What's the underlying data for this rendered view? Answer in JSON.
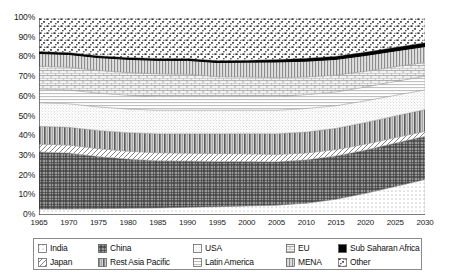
{
  "chart_data": {
    "type": "area",
    "title": "",
    "xlabel": "",
    "ylabel": "",
    "stacked": true,
    "percent_stacked": true,
    "grid": false,
    "legend_position": "bottom",
    "xlim": [
      1965,
      2030
    ],
    "ylim": [
      0,
      100
    ],
    "x": [
      1965,
      1970,
      1975,
      1980,
      1985,
      1990,
      1995,
      2000,
      2005,
      2010,
      2015,
      2020,
      2025,
      2030
    ],
    "xtick_labels": [
      "1965",
      "1970",
      "1975",
      "1980",
      "1985",
      "1990",
      "1995",
      "2000",
      "2005",
      "2010",
      "2015",
      "2020",
      "2025",
      "2030"
    ],
    "ytick_labels": [
      "0%",
      "10%",
      "20%",
      "30%",
      "40%",
      "50%",
      "60%",
      "70%",
      "80%",
      "90%",
      "100%"
    ],
    "ytick_values": [
      0,
      10,
      20,
      30,
      40,
      50,
      60,
      70,
      80,
      90,
      100
    ],
    "stack_order_bottom_to_top": [
      "India",
      "China",
      "Japan",
      "Rest Asia Pacific",
      "USA",
      "Latin America",
      "EU",
      "MENA",
      "Sub Saharan Africa",
      "Other"
    ],
    "series": [
      {
        "name": "India",
        "pattern": "dots-sparse",
        "values": [
          3.0,
          3.0,
          3.2,
          3.4,
          3.6,
          3.9,
          4.2,
          4.6,
          5.0,
          6.0,
          8.0,
          11.0,
          14.5,
          18.0
        ]
      },
      {
        "name": "China",
        "pattern": "crosshatch-dark",
        "values": [
          29.0,
          28.5,
          26.5,
          25.0,
          24.0,
          23.5,
          23.0,
          22.5,
          22.0,
          22.0,
          22.0,
          22.0,
          22.0,
          22.0
        ]
      },
      {
        "name": "Japan",
        "pattern": "diagonal-left",
        "values": [
          4.0,
          4.0,
          4.0,
          4.0,
          4.0,
          4.0,
          4.0,
          4.0,
          3.8,
          3.5,
          3.2,
          3.0,
          2.8,
          2.5
        ]
      },
      {
        "name": "Rest Asia Pacific",
        "pattern": "vertical-bars",
        "values": [
          9.0,
          9.0,
          9.2,
          9.4,
          9.6,
          9.8,
          10.0,
          10.2,
          10.4,
          10.6,
          10.8,
          11.0,
          11.0,
          11.0
        ]
      },
      {
        "name": "USA",
        "pattern": "dots-fine",
        "values": [
          12.0,
          12.0,
          12.0,
          12.0,
          12.0,
          12.0,
          12.0,
          12.0,
          12.0,
          12.0,
          11.5,
          11.0,
          10.5,
          10.0
        ]
      },
      {
        "name": "Latin America",
        "pattern": "horizontal-lines",
        "values": [
          7.0,
          7.0,
          7.0,
          7.0,
          7.0,
          7.0,
          7.0,
          7.0,
          7.0,
          7.0,
          7.0,
          7.0,
          7.0,
          7.0
        ]
      },
      {
        "name": "EU",
        "pattern": "brick",
        "values": [
          11.5,
          11.5,
          11.5,
          11.5,
          11.5,
          11.3,
          10.0,
          9.8,
          9.5,
          9.0,
          8.5,
          8.0,
          7.5,
          7.0
        ]
      },
      {
        "name": "MENA",
        "pattern": "dense-vertical",
        "values": [
          6.5,
          6.5,
          6.5,
          6.7,
          6.8,
          7.0,
          7.2,
          7.5,
          8.0,
          8.0,
          8.0,
          8.0,
          8.0,
          8.0
        ]
      },
      {
        "name": "Sub Saharan Africa",
        "pattern": "solid-black",
        "values": [
          1.0,
          1.0,
          1.0,
          1.0,
          1.0,
          1.0,
          1.0,
          1.0,
          1.2,
          1.5,
          1.6,
          1.7,
          1.8,
          2.0
        ]
      },
      {
        "name": "Other",
        "pattern": "confetti",
        "values": [
          17.0,
          17.5,
          19.1,
          20.0,
          20.5,
          20.5,
          21.6,
          21.4,
          21.1,
          20.4,
          19.4,
          17.3,
          15.9,
          12.5
        ]
      }
    ],
    "boundary_curves_percent_cumulative": {
      "India_top": [
        3.0,
        3.0,
        3.2,
        3.4,
        3.6,
        3.9,
        4.2,
        4.6,
        5.0,
        6.0,
        8.0,
        11.0,
        14.5,
        18.0
      ],
      "China_top": [
        32.0,
        31.5,
        29.7,
        28.4,
        27.6,
        27.4,
        27.2,
        27.1,
        27.0,
        28.0,
        30.0,
        33.0,
        36.5,
        40.0
      ],
      "Japan_top": [
        36.0,
        35.5,
        33.7,
        32.4,
        31.6,
        31.4,
        31.2,
        31.1,
        30.8,
        31.5,
        33.2,
        36.0,
        39.3,
        42.5
      ],
      "RestAsiaPacific_top": [
        45.0,
        44.5,
        42.9,
        41.8,
        41.2,
        41.2,
        41.2,
        41.3,
        41.2,
        42.1,
        44.0,
        47.0,
        50.3,
        53.5
      ],
      "USA_top": [
        57.0,
        56.5,
        54.9,
        53.8,
        53.2,
        53.2,
        53.2,
        53.3,
        53.2,
        54.1,
        55.5,
        58.0,
        60.8,
        63.5
      ],
      "LatinAmerica_top": [
        64.0,
        63.5,
        61.9,
        60.8,
        60.2,
        60.2,
        60.2,
        60.3,
        60.2,
        61.1,
        62.5,
        65.0,
        67.8,
        70.5
      ],
      "EU_top": [
        75.5,
        75.0,
        73.4,
        72.3,
        71.7,
        71.5,
        70.2,
        70.1,
        69.7,
        70.1,
        71.0,
        73.0,
        75.3,
        77.5
      ],
      "MENA_top": [
        82.0,
        81.5,
        79.9,
        79.0,
        78.5,
        78.5,
        77.4,
        77.6,
        77.7,
        78.1,
        79.0,
        81.0,
        83.3,
        85.5
      ],
      "SubSaharanAfrica_top": [
        83.0,
        82.5,
        80.9,
        80.0,
        79.5,
        79.5,
        78.4,
        78.6,
        78.9,
        79.6,
        80.6,
        82.7,
        85.1,
        87.5
      ],
      "Other_top": [
        100,
        100,
        100,
        100,
        100,
        100,
        100,
        100,
        100,
        100,
        100,
        100,
        100,
        100
      ]
    }
  },
  "legend": {
    "rows": [
      [
        {
          "label": "India",
          "pattern": "dots-sparse"
        },
        {
          "label": "China",
          "pattern": "crosshatch-dark"
        },
        {
          "label": "USA",
          "pattern": "dots-fine"
        },
        {
          "label": "EU",
          "pattern": "brick"
        },
        {
          "label": "Sub Saharan Africa",
          "pattern": "solid-black"
        }
      ],
      [
        {
          "label": "Japan",
          "pattern": "diagonal-left"
        },
        {
          "label": "Rest Asia Pacific",
          "pattern": "vertical-bars"
        },
        {
          "label": "Latin America",
          "pattern": "horizontal-lines"
        },
        {
          "label": "MENA",
          "pattern": "dense-vertical"
        },
        {
          "label": "Other",
          "pattern": "confetti"
        }
      ]
    ]
  },
  "colors": {
    "axis": "#1a1a1a",
    "background": "#ffffff",
    "legend_border": "#8a8a8a",
    "sub_saharan_africa": "#000000"
  }
}
